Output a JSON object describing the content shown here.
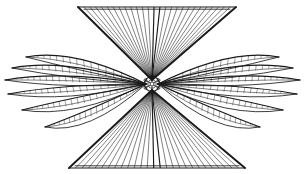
{
  "figure": {
    "medium": "line engraving",
    "ink_color": "#1a1a1a",
    "background_color": "#ffffff",
    "canvas": {
      "width": 305,
      "height": 174
    },
    "hub": {
      "label": "central hub",
      "cx": 152,
      "cy": 84,
      "outer_radius": 7.5,
      "inner_radius": 4.2,
      "core_radius": 2.0,
      "boss_count": 6
    },
    "wings": [
      {
        "name": "upper-fan-wing",
        "type": "triangular-fan",
        "orientation": "up",
        "apex": {
          "x": 152,
          "y": 80
        },
        "edge_left": {
          "x": 78,
          "y": 7
        },
        "edge_right": {
          "x": 236,
          "y": 7
        },
        "rib_count": 27,
        "spar_stroke": "heavy"
      },
      {
        "name": "lower-fan-wing",
        "type": "triangular-fan",
        "orientation": "down",
        "apex": {
          "x": 152,
          "y": 90
        },
        "edge_left": {
          "x": 69,
          "y": 168
        },
        "edge_right": {
          "x": 245,
          "y": 168
        },
        "rib_count": 27,
        "spar_stroke": "heavy"
      },
      {
        "name": "left-feather-wing",
        "type": "feather-blades",
        "orientation": "left",
        "root": {
          "x": 146,
          "y": 84
        },
        "blade_count": 6,
        "tip_min_x": 5,
        "hatching": true
      },
      {
        "name": "right-feather-wing",
        "type": "feather-blades",
        "orientation": "right",
        "root": {
          "x": 158,
          "y": 84
        },
        "blade_count": 6,
        "tip_max_x": 300,
        "hatching": true
      }
    ],
    "left_blades": [
      {
        "index": 0,
        "tip_x": 26,
        "tip_y": 57,
        "ctrl_x": 74,
        "ctrl_y": 48,
        "back_y": 70,
        "hatch_count": 16
      },
      {
        "index": 1,
        "tip_x": 12,
        "tip_y": 68,
        "ctrl_x": 66,
        "ctrl_y": 58,
        "back_y": 79,
        "hatch_count": 18
      },
      {
        "index": 2,
        "tip_x": 5,
        "tip_y": 80,
        "ctrl_x": 62,
        "ctrl_y": 70,
        "back_y": 89,
        "hatch_count": 20
      },
      {
        "index": 3,
        "tip_x": 8,
        "tip_y": 94,
        "ctrl_x": 62,
        "ctrl_y": 84,
        "back_y": 103,
        "hatch_count": 20
      },
      {
        "index": 4,
        "tip_x": 22,
        "tip_y": 110,
        "ctrl_x": 70,
        "ctrl_y": 98,
        "back_y": 119,
        "hatch_count": 19
      },
      {
        "index": 5,
        "tip_x": 45,
        "tip_y": 127,
        "ctrl_x": 86,
        "ctrl_y": 112,
        "back_y": 136,
        "hatch_count": 17
      }
    ],
    "right_blades": [
      {
        "index": 0,
        "tip_x": 279,
        "tip_y": 57,
        "ctrl_x": 231,
        "ctrl_y": 48,
        "back_y": 70,
        "hatch_count": 16
      },
      {
        "index": 1,
        "tip_x": 293,
        "tip_y": 68,
        "ctrl_x": 239,
        "ctrl_y": 58,
        "back_y": 79,
        "hatch_count": 18
      },
      {
        "index": 2,
        "tip_x": 300,
        "tip_y": 80,
        "ctrl_x": 243,
        "ctrl_y": 70,
        "back_y": 89,
        "hatch_count": 20
      },
      {
        "index": 3,
        "tip_x": 297,
        "tip_y": 94,
        "ctrl_x": 243,
        "ctrl_y": 84,
        "back_y": 103,
        "hatch_count": 20
      },
      {
        "index": 4,
        "tip_x": 283,
        "tip_y": 110,
        "ctrl_x": 235,
        "ctrl_y": 98,
        "back_y": 119,
        "hatch_count": 19
      },
      {
        "index": 5,
        "tip_x": 260,
        "tip_y": 127,
        "ctrl_x": 219,
        "ctrl_y": 112,
        "back_y": 136,
        "hatch_count": 17
      }
    ]
  }
}
